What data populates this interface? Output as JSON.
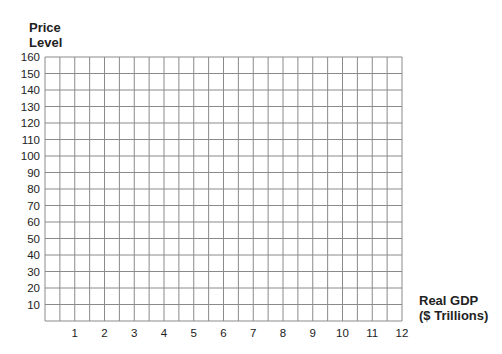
{
  "chart_data": {
    "type": "line",
    "title": "",
    "xlabel": "Real GDP ($ Trillions)",
    "xlabel_lines": [
      "Real GDP",
      "($ Trillions)"
    ],
    "ylabel": "Price Level",
    "ylabel_lines": [
      "Price",
      "Level"
    ],
    "x_ticks": [
      "1",
      "2",
      "3",
      "4",
      "5",
      "6",
      "7",
      "8",
      "9",
      "10",
      "11",
      "12"
    ],
    "y_ticks": [
      "160",
      "150",
      "140",
      "130",
      "120",
      "110",
      "100",
      "90",
      "80",
      "70",
      "60",
      "50",
      "40",
      "30",
      "20",
      "10"
    ],
    "xlim": [
      0,
      12
    ],
    "ylim": [
      0,
      160
    ],
    "grid": true,
    "grid_minor_x_step": 0.5,
    "grid_y_step": 10,
    "series": [],
    "legend": null
  }
}
